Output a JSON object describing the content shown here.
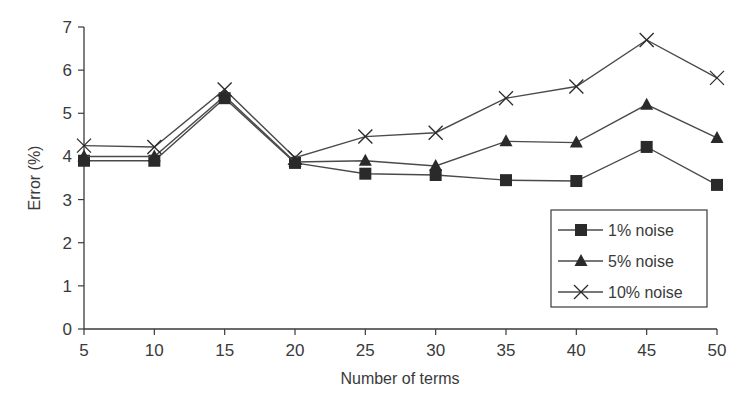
{
  "chart_data": {
    "type": "line",
    "title": "",
    "xlabel": "Number of terms",
    "ylabel": "Error (%)",
    "x": [
      5,
      10,
      15,
      20,
      25,
      30,
      35,
      40,
      45,
      50
    ],
    "xticks": [
      "5",
      "10",
      "15",
      "20",
      "25",
      "30",
      "35",
      "40",
      "45",
      "50"
    ],
    "yticks": [
      "0",
      "1",
      "2",
      "3",
      "4",
      "5",
      "6",
      "7"
    ],
    "xlim": [
      5,
      50
    ],
    "ylim": [
      0,
      7
    ],
    "grid": false,
    "legend_position": "lower right",
    "series": [
      {
        "name": "1% noise",
        "marker": "square",
        "values": [
          3.9,
          3.9,
          5.35,
          3.85,
          3.6,
          3.57,
          3.45,
          3.43,
          4.22,
          3.34
        ]
      },
      {
        "name": "5% noise",
        "marker": "triangle",
        "values": [
          4.0,
          4.0,
          5.4,
          3.87,
          3.9,
          3.78,
          4.35,
          4.32,
          5.2,
          4.43
        ]
      },
      {
        "name": "10% noise",
        "marker": "x",
        "values": [
          4.25,
          4.22,
          5.55,
          3.97,
          4.46,
          4.55,
          5.35,
          5.62,
          6.7,
          5.82
        ]
      }
    ]
  },
  "colors": {
    "line": "#4a4a4a",
    "marker": "#2a2a2a",
    "axis": "#3a3a3a"
  }
}
